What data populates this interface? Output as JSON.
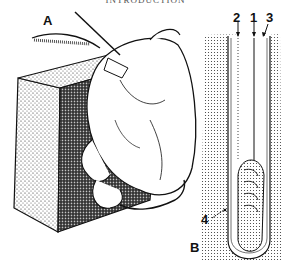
{
  "header": {
    "running_title": "INTRODUCTION"
  },
  "figure": {
    "panel_a": {
      "label": "A"
    },
    "panel_b": {
      "label": "B",
      "callouts": [
        "2",
        "1",
        "3",
        "4"
      ]
    }
  }
}
